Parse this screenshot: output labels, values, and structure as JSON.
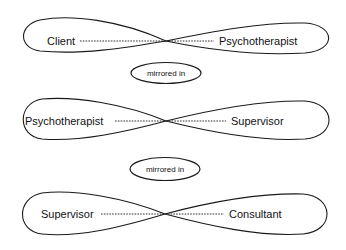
{
  "diagram": {
    "type": "mirrored-relationships",
    "rows": [
      {
        "left": "Client",
        "right": "Psychotherapist"
      },
      {
        "left": "Psychotherapist",
        "right": "Supervisor"
      },
      {
        "left": "Supervisor",
        "right": "Consultant"
      }
    ],
    "connectors": [
      {
        "label": "mirrored in"
      },
      {
        "label": "mirrored in"
      }
    ],
    "colors": {
      "stroke": "#1a1a1a",
      "background": "#ffffff"
    }
  }
}
